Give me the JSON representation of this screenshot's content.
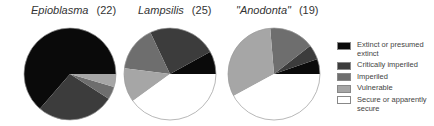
{
  "chart_data": {
    "type": "pie",
    "categories": [
      "Extinct or presumed extinct",
      "Critically imperiled",
      "Imperiled",
      "Vulnerable",
      "Secure or apparently secure"
    ],
    "colors": [
      "#0a0a0a",
      "#3c3c3c",
      "#6e6e6e",
      "#a6a6a6",
      "#ffffff"
    ],
    "legend_position": "right",
    "series": [
      {
        "name": "Epioblasma",
        "title_genus": "Epioblasma",
        "title_count": "(22)",
        "total": 22,
        "values": [
          14,
          6,
          1,
          1,
          0
        ]
      },
      {
        "name": "Lampsilis",
        "title_genus": "Lampsilis",
        "title_count": "(25)",
        "total": 25,
        "values": [
          2,
          6,
          4,
          3,
          10
        ]
      },
      {
        "name": "\"Anodonta\"",
        "title_genus": "\"Anodonta\"",
        "title_count": "(19)",
        "total": 19,
        "values": [
          1,
          1,
          3,
          6,
          8
        ]
      }
    ]
  },
  "legend": [
    {
      "label": "Extinct or presumed extinct",
      "color": "#0a0a0a"
    },
    {
      "label": "Critically imperiled",
      "color": "#3c3c3c"
    },
    {
      "label": "Imperiled",
      "color": "#6e6e6e"
    },
    {
      "label": "Vulnerable",
      "color": "#a6a6a6"
    },
    {
      "label": "Secure or apparently secure",
      "color": "#ffffff"
    }
  ]
}
